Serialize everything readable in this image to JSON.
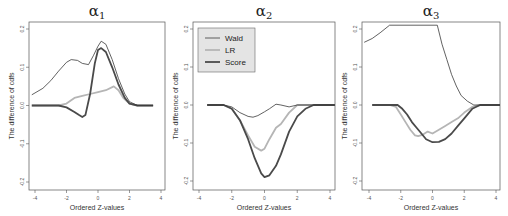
{
  "figure": {
    "width": 508,
    "height": 216
  },
  "legend": {
    "entries": [
      {
        "label": "Wald",
        "color": "#3a3a3a",
        "width": 0.8
      },
      {
        "label": "LR",
        "color": "#b5b5b5",
        "width": 1.8
      },
      {
        "label": "Score",
        "color": "#4a4a4a",
        "width": 1.8
      }
    ],
    "background": "#e4e4e4"
  },
  "chart_data": [
    {
      "type": "line",
      "title": "α1",
      "title_symbol": "α",
      "title_subscript": "1",
      "xlabel": "Ordered Z-values",
      "ylabel": "The difference of cdfs",
      "xlim": [
        -4.4,
        4.2
      ],
      "ylim": [
        -0.22,
        0.21
      ],
      "xticks": [
        "-4",
        "-2",
        "0",
        "2",
        "4"
      ],
      "yticks": [
        "0.2",
        "0.1",
        "0.0",
        "-0.1",
        "-0.2"
      ],
      "grid": false,
      "series": [
        {
          "name": "Wald",
          "x": [
            -4.2,
            -3.5,
            -3.0,
            -2.5,
            -2.0,
            -1.7,
            -1.3,
            -1.0,
            -0.6,
            -0.3,
            0.0,
            0.2,
            0.5,
            0.9,
            1.3,
            1.7,
            2.0,
            2.5,
            3.0,
            3.5
          ],
          "y": [
            0.028,
            0.045,
            0.065,
            0.09,
            0.113,
            0.12,
            0.118,
            0.11,
            0.107,
            0.13,
            0.155,
            0.168,
            0.16,
            0.12,
            0.07,
            0.03,
            0.01,
            0.0,
            0.0,
            0.0
          ]
        },
        {
          "name": "LR",
          "x": [
            -4.2,
            -3.0,
            -2.5,
            -2.0,
            -1.5,
            -1.0,
            -0.5,
            0.0,
            0.5,
            1.0,
            1.3,
            1.6,
            2.0,
            2.5,
            3.0,
            3.5
          ],
          "y": [
            0.0,
            0.0,
            0.0,
            0.005,
            0.02,
            0.025,
            0.03,
            0.035,
            0.04,
            0.05,
            0.04,
            0.02,
            0.005,
            0.0,
            0.0,
            0.0
          ]
        },
        {
          "name": "Score",
          "x": [
            -4.2,
            -3.0,
            -2.5,
            -2.0,
            -1.5,
            -1.2,
            -1.0,
            -0.8,
            -0.5,
            -0.2,
            0.0,
            0.2,
            0.5,
            0.9,
            1.3,
            1.7,
            2.0,
            2.5,
            3.0,
            3.5
          ],
          "y": [
            0.0,
            0.0,
            0.0,
            -0.005,
            -0.017,
            -0.025,
            -0.03,
            -0.025,
            0.03,
            0.11,
            0.145,
            0.15,
            0.14,
            0.1,
            0.055,
            0.02,
            0.005,
            0.0,
            0.0,
            0.0
          ]
        }
      ]
    },
    {
      "type": "line",
      "title": "α2",
      "title_symbol": "α",
      "title_subscript": "2",
      "xlabel": "Ordered Z-values",
      "ylabel": "The difference of cdfs",
      "xlim": [
        -4.4,
        4.3
      ],
      "ylim": [
        -0.22,
        0.21
      ],
      "xticks": [
        "-4",
        "-2",
        "0",
        "2",
        "4"
      ],
      "yticks": [
        "0.2",
        "0.1",
        "0.0",
        "-0.1",
        "-0.2"
      ],
      "grid": false,
      "legend_position": "top-left",
      "series": [
        {
          "name": "Wald",
          "x": [
            -3.5,
            -2.5,
            -2.0,
            -1.5,
            -1.0,
            -0.7,
            -0.4,
            0.0,
            0.3,
            0.7,
            1.0,
            1.5,
            2.0,
            3.0,
            4.3
          ],
          "y": [
            0.0,
            0.0,
            -0.005,
            -0.02,
            -0.03,
            -0.032,
            -0.028,
            -0.018,
            -0.01,
            0.002,
            0.0,
            -0.005,
            0.0,
            0.0,
            0.0
          ]
        },
        {
          "name": "LR",
          "x": [
            -3.5,
            -2.5,
            -2.0,
            -1.5,
            -1.0,
            -0.6,
            -0.2,
            0.0,
            0.3,
            0.7,
            1.0,
            1.5,
            2.0,
            3.0,
            4.3
          ],
          "y": [
            0.0,
            0.0,
            -0.01,
            -0.04,
            -0.08,
            -0.11,
            -0.12,
            -0.115,
            -0.09,
            -0.06,
            -0.05,
            -0.02,
            0.0,
            0.0,
            0.0
          ]
        },
        {
          "name": "Score",
          "x": [
            -3.5,
            -2.5,
            -2.0,
            -1.5,
            -1.0,
            -0.6,
            -0.2,
            0.0,
            0.3,
            0.7,
            1.0,
            1.5,
            2.0,
            2.5,
            3.0,
            4.3
          ],
          "y": [
            0.0,
            0.0,
            -0.01,
            -0.04,
            -0.09,
            -0.14,
            -0.18,
            -0.19,
            -0.185,
            -0.16,
            -0.13,
            -0.07,
            -0.03,
            -0.01,
            0.0,
            0.0
          ]
        }
      ]
    },
    {
      "type": "line",
      "title": "α3",
      "title_symbol": "α",
      "title_subscript": "3",
      "xlabel": "Ordered Z-values",
      "ylabel": "The difference of cdfs",
      "xlim": [
        -4.3,
        4.3
      ],
      "ylim": [
        -0.22,
        0.21
      ],
      "xticks": [
        "-4",
        "-2",
        "0",
        "2",
        "4"
      ],
      "yticks": [
        "0.2",
        "0.1",
        "0.0",
        "-0.1",
        "-0.2"
      ],
      "grid": false,
      "series": [
        {
          "name": "Wald",
          "x": [
            -4.3,
            -3.8,
            -3.3,
            -2.7,
            0.3,
            0.6,
            0.9,
            1.2,
            1.5,
            1.8,
            2.2,
            2.6,
            3.0,
            3.5,
            4.3
          ],
          "y": [
            0.165,
            0.175,
            0.19,
            0.21,
            0.21,
            0.16,
            0.12,
            0.08,
            0.05,
            0.025,
            0.01,
            0.0,
            0.0,
            0.0,
            0.0
          ]
        },
        {
          "name": "LR",
          "x": [
            -3.8,
            -2.7,
            -2.3,
            -2.0,
            -1.7,
            -1.4,
            -1.1,
            -0.9,
            -0.6,
            -0.3,
            0.0,
            0.4,
            0.8,
            1.2,
            1.6,
            2.0,
            2.5,
            3.0,
            4.3
          ],
          "y": [
            0.0,
            0.0,
            -0.005,
            -0.025,
            -0.045,
            -0.065,
            -0.08,
            -0.082,
            -0.078,
            -0.07,
            -0.075,
            -0.065,
            -0.055,
            -0.045,
            -0.035,
            -0.02,
            -0.005,
            0.0,
            0.0
          ]
        },
        {
          "name": "Score",
          "x": [
            -3.8,
            -2.7,
            -2.2,
            -1.9,
            -1.6,
            -1.3,
            -1.0,
            -0.7,
            -0.4,
            0.0,
            0.4,
            0.8,
            1.2,
            1.6,
            2.0,
            2.5,
            3.0,
            4.3
          ],
          "y": [
            0.0,
            0.0,
            0.0,
            -0.01,
            -0.025,
            -0.045,
            -0.06,
            -0.075,
            -0.09,
            -0.098,
            -0.097,
            -0.09,
            -0.075,
            -0.055,
            -0.035,
            -0.01,
            0.0,
            0.0
          ]
        }
      ]
    }
  ],
  "panels_layout": [
    {
      "frame": [
        29,
        22,
        165,
        190
      ],
      "x0": 35,
      "x1": 161,
      "y_top": 29,
      "y_bot": 182
    },
    {
      "frame": [
        193,
        22,
        335,
        190
      ],
      "x0": 199,
      "x1": 330,
      "y_top": 29,
      "y_bot": 181
    },
    {
      "frame": [
        362,
        22,
        500,
        190
      ],
      "x0": 369,
      "x1": 496,
      "y_top": 29,
      "y_bot": 181
    }
  ]
}
